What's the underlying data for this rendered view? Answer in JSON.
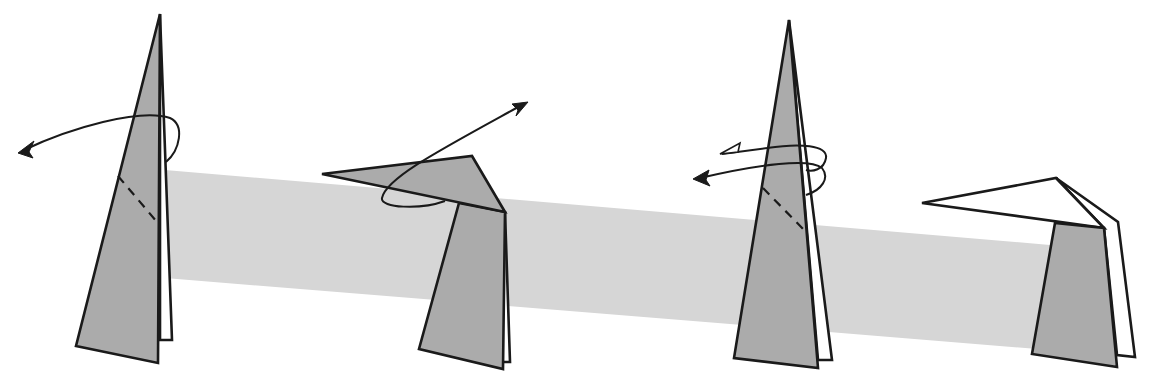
{
  "diagram": {
    "type": "origami-instruction",
    "background_band": {
      "color": "#d6d6d6",
      "description": "Light gray diagonal band behind the steps"
    },
    "colors": {
      "paper_colored_side": "#ababab",
      "paper_white_side": "#ffffff",
      "line": "#1a1a1a"
    },
    "steps": [
      {
        "index": 1,
        "shape": "tall narrow triangle (colored) with white back layer",
        "fold_line": "dashed diagonal valley line",
        "arrow": "curved arrow wrapping around the flap, pointing left"
      },
      {
        "index": 2,
        "shape": "flap folded out to the left over a trapezoid base",
        "fold_line": "none",
        "arrow": "curved arrow looping under flap, pointing up-right"
      },
      {
        "index": 3,
        "shape": "tall narrow triangle (colored) with white back layer",
        "fold_line": "dashed diagonal line",
        "arrow": "double looping arrow (open and filled heads) pointing left"
      },
      {
        "index": 4,
        "shape": "white flap folded left over a colored trapezoid base",
        "fold_line": "none",
        "arrow": "none"
      }
    ]
  }
}
